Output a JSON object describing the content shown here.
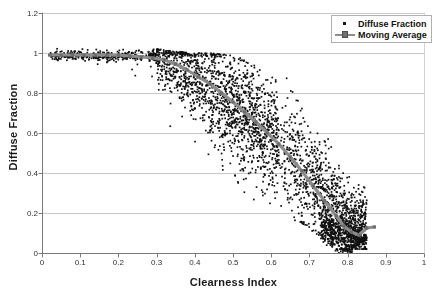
{
  "chart_data": {
    "type": "scatter",
    "title": "",
    "xlabel": "Clearness Index",
    "ylabel": "Diffuse Fraction",
    "xlim": [
      0,
      1
    ],
    "ylim": [
      0,
      1.2
    ],
    "grid": "horizontal",
    "legend_position": "top-right",
    "xticks": [
      "0",
      "0.1",
      "0.2",
      "0.3",
      "0.4",
      "0.5",
      "0.6",
      "0.7",
      "0.8",
      "0.9",
      "1"
    ],
    "xtick_values": [
      0,
      0.1,
      0.2,
      0.3,
      0.4,
      0.5,
      0.6,
      0.7,
      0.8,
      0.9,
      1
    ],
    "yticks": [
      "0",
      "0.2",
      "0.4",
      "0.6",
      "0.8",
      "1",
      "1.2"
    ],
    "ytick_values": [
      0,
      0.2,
      0.4,
      0.6,
      0.8,
      1,
      1.2
    ],
    "series": [
      {
        "name": "Diffuse Fraction",
        "type": "scatter",
        "marker": "dot",
        "color": "#111111",
        "point_count": 3000,
        "description": "Dense cloud of hourly diffuse-fraction observations; near 1.0 and tight for clearness index below 0.30, then spreading widely and falling toward 0.1 as clearness index approaches 0.85.",
        "envelope_x": [
          0.02,
          0.1,
          0.2,
          0.3,
          0.35,
          0.4,
          0.45,
          0.5,
          0.55,
          0.6,
          0.65,
          0.7,
          0.75,
          0.8,
          0.85,
          0.88
        ],
        "envelope_upper": [
          1.02,
          1.02,
          1.02,
          1.02,
          1.01,
          1.0,
          1.0,
          0.99,
          0.95,
          0.92,
          0.88,
          0.8,
          0.66,
          0.52,
          0.49,
          0.37
        ],
        "envelope_lower": [
          0.96,
          0.9,
          0.91,
          0.75,
          0.54,
          0.43,
          0.32,
          0.3,
          0.27,
          0.24,
          0.17,
          0.12,
          0.05,
          0.0,
          0.07,
          0.11
        ],
        "envelope_center": [
          0.99,
          0.99,
          0.99,
          0.98,
          0.94,
          0.89,
          0.82,
          0.74,
          0.66,
          0.58,
          0.47,
          0.36,
          0.24,
          0.13,
          0.13,
          0.13
        ]
      },
      {
        "name": "Moving Average",
        "type": "line",
        "marker": "square",
        "color": "#8c8c8c",
        "x": [
          0.02,
          0.05,
          0.08,
          0.11,
          0.14,
          0.17,
          0.2,
          0.23,
          0.26,
          0.29,
          0.32,
          0.35,
          0.38,
          0.41,
          0.44,
          0.47,
          0.5,
          0.53,
          0.56,
          0.59,
          0.62,
          0.65,
          0.68,
          0.71,
          0.74,
          0.77,
          0.79,
          0.81,
          0.83,
          0.85,
          0.87
        ],
        "y": [
          0.99,
          0.99,
          0.99,
          0.99,
          0.99,
          0.99,
          0.99,
          0.985,
          0.98,
          0.975,
          0.965,
          0.945,
          0.915,
          0.88,
          0.845,
          0.8,
          0.755,
          0.705,
          0.655,
          0.6,
          0.545,
          0.48,
          0.41,
          0.335,
          0.26,
          0.185,
          0.135,
          0.105,
          0.09,
          0.125,
          0.13
        ]
      }
    ]
  },
  "legend": {
    "items": [
      {
        "label": "Diffuse Fraction",
        "key": "dot-marker"
      },
      {
        "label": "Moving Average",
        "key": "line-square-marker"
      }
    ]
  },
  "colors": {
    "scatter": "#111111",
    "moving_average": "#8c8c8c",
    "gridline": "#c8c8c8",
    "axis": "#7a7a7a",
    "text": "#1a1a1a"
  }
}
